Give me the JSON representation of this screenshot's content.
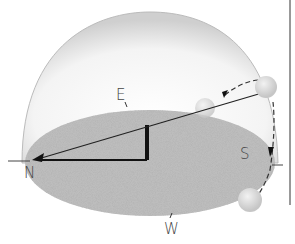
{
  "diagram": {
    "labels": {
      "east": "E",
      "north": "N",
      "south": "S",
      "west": "W"
    },
    "colors": {
      "ground": "#b4b4b4",
      "dome": "#e8e8e8",
      "sun": "#dcdcdc",
      "lines": "#111111"
    }
  }
}
